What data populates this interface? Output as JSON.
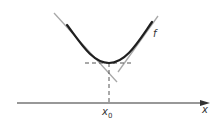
{
  "diagram": {
    "function_label": "f",
    "x_axis_label": "x",
    "point_label": "x",
    "point_subscript": "0",
    "colors": {
      "curve": "#1f1f1f",
      "axis": "#333333",
      "tangent": "#a8a8a8",
      "dashed": "#555555",
      "background": "#ffffff"
    }
  }
}
